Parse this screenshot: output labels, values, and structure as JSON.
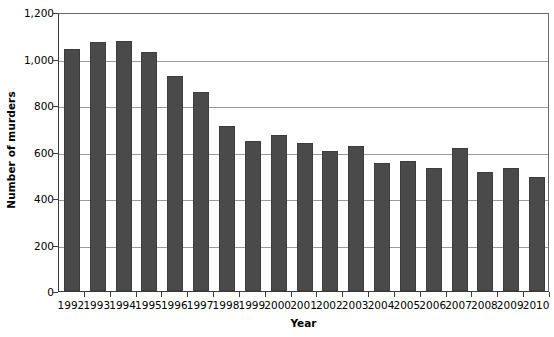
{
  "chart_data": {
    "type": "bar",
    "title": "",
    "xlabel": "Year",
    "ylabel": "Number of murders",
    "categories": [
      "1992",
      "1993",
      "1994",
      "1995",
      "1996",
      "1997",
      "1998",
      "1999",
      "2000",
      "2001",
      "2002",
      "2003",
      "2004",
      "2005",
      "2006",
      "2007",
      "2008",
      "2009",
      "2010"
    ],
    "values": [
      1040,
      1070,
      1075,
      1030,
      925,
      858,
      710,
      647,
      672,
      637,
      602,
      623,
      551,
      558,
      529,
      616,
      514,
      529,
      491
    ],
    "ylim": [
      0,
      1200
    ],
    "y_ticks": [
      0,
      200,
      400,
      600,
      800,
      1000,
      1200
    ],
    "y_tick_labels": [
      "0",
      "200",
      "400",
      "600",
      "800",
      "1,000",
      "1,200"
    ],
    "grid": true,
    "grid_axis": "y",
    "legend": false,
    "bar_color": "#4a4a4a",
    "gridline_color": "#9a9a9a",
    "axis_color": "#3a3a3a",
    "background_color": "#ffffff"
  },
  "axes": {
    "y_title": "Number of murders",
    "x_title": "Year"
  }
}
